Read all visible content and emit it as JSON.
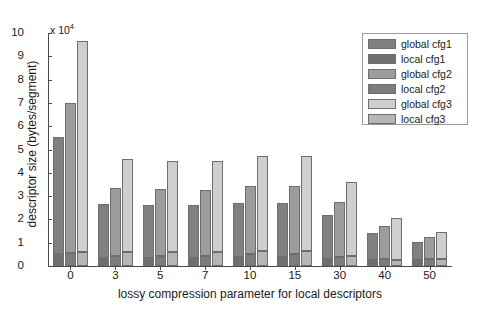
{
  "chart_data": {
    "type": "bar",
    "subtype": "grouped-stacked",
    "title": "",
    "xlabel": "lossy compression parameter for local descriptors",
    "ylabel": "descriptor size (bytes/segment)",
    "y_multiplier": "x 10",
    "y_multiplier_exp": "4",
    "categories": [
      "0",
      "3",
      "5",
      "7",
      "10",
      "15",
      "30",
      "40",
      "50"
    ],
    "ylim": [
      0,
      10
    ],
    "yticks": [
      0,
      1,
      2,
      3,
      4,
      5,
      6,
      7,
      8,
      9,
      10
    ],
    "ytick_labels": [
      "0",
      "1",
      "2",
      "3",
      "4",
      "5",
      "6",
      "7",
      "8",
      "9",
      "10"
    ],
    "grid": false,
    "legend_position": "top-right",
    "series": [
      {
        "name": "global cfg1",
        "color": "#808080",
        "values": [
          5.05,
          2.3,
          2.25,
          2.25,
          2.3,
          2.3,
          1.9,
          1.15,
          0.8
        ]
      },
      {
        "name": "local cfg1",
        "color": "#6e6e6e",
        "values": [
          0.5,
          0.35,
          0.35,
          0.35,
          0.4,
          0.4,
          0.3,
          0.25,
          0.25
        ]
      },
      {
        "name": "global cfg2",
        "color": "#9c9c9c",
        "values": [
          6.45,
          2.9,
          2.85,
          2.8,
          2.95,
          2.95,
          2.35,
          1.4,
          0.95
        ]
      },
      {
        "name": "local cfg2",
        "color": "#7d7d7d",
        "values": [
          0.55,
          0.45,
          0.45,
          0.45,
          0.5,
          0.5,
          0.4,
          0.3,
          0.3
        ]
      },
      {
        "name": "global cfg3",
        "color": "#cfcfcf",
        "values": [
          9.05,
          4.0,
          3.9,
          3.9,
          4.05,
          4.05,
          3.15,
          1.8,
          1.15
        ]
      },
      {
        "name": "local cfg3",
        "color": "#b6b6b6",
        "values": [
          0.6,
          0.6,
          0.6,
          0.6,
          0.65,
          0.65,
          0.45,
          0.25,
          0.3
        ]
      }
    ],
    "bar_totals": {
      "cfg1": [
        5.55,
        2.65,
        2.6,
        2.6,
        2.7,
        2.7,
        2.2,
        1.4,
        1.05
      ],
      "cfg2": [
        7.0,
        3.35,
        3.3,
        3.25,
        3.45,
        3.45,
        2.75,
        1.7,
        1.25
      ],
      "cfg3": [
        9.65,
        4.6,
        4.5,
        4.5,
        4.7,
        4.7,
        3.6,
        2.05,
        1.45
      ]
    }
  },
  "legend": {
    "items": [
      {
        "label": "global cfg1",
        "color": "#808080"
      },
      {
        "label": "local cfg1",
        "color": "#6e6e6e"
      },
      {
        "label": "global cfg2",
        "color": "#9c9c9c"
      },
      {
        "label": "local cfg2",
        "color": "#7d7d7d"
      },
      {
        "label": "global cfg3",
        "color": "#cfcfcf"
      },
      {
        "label": "local cfg3",
        "color": "#b6b6b6"
      }
    ]
  },
  "axes": {
    "x_title": "lossy compression parameter for local descriptors",
    "y_title": "descriptor size (bytes/segment)",
    "y_multiplier_prefix": "x 10",
    "y_multiplier_exponent": "4"
  },
  "colors": {
    "axis": "#4a4a4a",
    "text": "#1a1a1a",
    "background": "#ffffff",
    "bar_edge": "#6e6e6e",
    "legend_border": "#9a9a9a"
  }
}
